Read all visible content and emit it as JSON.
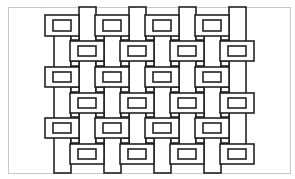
{
  "diagram": {
    "title": "",
    "colors": {
      "stroke": "#222222",
      "fill": "#ffffff",
      "frame": "#c8c8c8",
      "background": "#ffffff"
    },
    "frame": {
      "x": 8,
      "y": 7,
      "w": 282,
      "h": 166
    },
    "vertical_bands": [
      {
        "x": 54,
        "y": 30,
        "w": 17,
        "h": 143
      },
      {
        "x": 79,
        "y": 7,
        "w": 17,
        "h": 143
      },
      {
        "x": 104,
        "y": 30,
        "w": 17,
        "h": 143
      },
      {
        "x": 129,
        "y": 7,
        "w": 17,
        "h": 143
      },
      {
        "x": 154,
        "y": 30,
        "w": 17,
        "h": 143
      },
      {
        "x": 179,
        "y": 7,
        "w": 17,
        "h": 143
      },
      {
        "x": 204,
        "y": 30,
        "w": 17,
        "h": 143
      },
      {
        "x": 229,
        "y": 7,
        "w": 17,
        "h": 143
      }
    ],
    "horizontal_blocks": [
      {
        "x": 45,
        "y": 15,
        "w": 34,
        "h": 21
      },
      {
        "x": 95,
        "y": 15,
        "w": 34,
        "h": 21
      },
      {
        "x": 145,
        "y": 15,
        "w": 34,
        "h": 21
      },
      {
        "x": 195,
        "y": 15,
        "w": 34,
        "h": 21
      },
      {
        "x": 70,
        "y": 41,
        "w": 34,
        "h": 20
      },
      {
        "x": 120,
        "y": 41,
        "w": 34,
        "h": 20
      },
      {
        "x": 170,
        "y": 41,
        "w": 34,
        "h": 20
      },
      {
        "x": 220,
        "y": 41,
        "w": 34,
        "h": 20
      },
      {
        "x": 45,
        "y": 67,
        "w": 34,
        "h": 20
      },
      {
        "x": 95,
        "y": 67,
        "w": 34,
        "h": 20
      },
      {
        "x": 145,
        "y": 67,
        "w": 34,
        "h": 20
      },
      {
        "x": 195,
        "y": 67,
        "w": 34,
        "h": 20
      },
      {
        "x": 70,
        "y": 93,
        "w": 34,
        "h": 20
      },
      {
        "x": 120,
        "y": 93,
        "w": 34,
        "h": 20
      },
      {
        "x": 170,
        "y": 93,
        "w": 34,
        "h": 20
      },
      {
        "x": 220,
        "y": 93,
        "w": 34,
        "h": 20
      },
      {
        "x": 45,
        "y": 118,
        "w": 34,
        "h": 20
      },
      {
        "x": 95,
        "y": 118,
        "w": 34,
        "h": 20
      },
      {
        "x": 145,
        "y": 118,
        "w": 34,
        "h": 20
      },
      {
        "x": 195,
        "y": 118,
        "w": 34,
        "h": 20
      },
      {
        "x": 70,
        "y": 144,
        "w": 34,
        "h": 20
      },
      {
        "x": 120,
        "y": 144,
        "w": 34,
        "h": 20
      },
      {
        "x": 170,
        "y": 144,
        "w": 34,
        "h": 20
      },
      {
        "x": 220,
        "y": 144,
        "w": 34,
        "h": 20
      }
    ],
    "inner_rect": {
      "inset_x": 8,
      "inset_y": 5
    },
    "connector_bars": {
      "height": 5
    }
  }
}
